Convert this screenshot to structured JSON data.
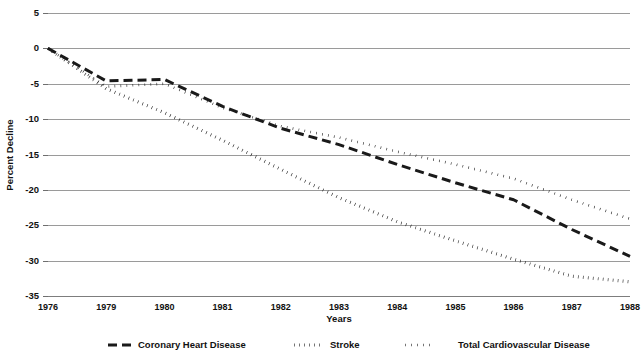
{
  "chart_data": {
    "type": "line",
    "title": "",
    "xlabel": "Years",
    "ylabel": "Percent Decline",
    "x": [
      1976,
      1979,
      1980,
      1981,
      1982,
      1983,
      1984,
      1985,
      1986,
      1987,
      1988
    ],
    "xtick_labels": [
      "1976",
      "1979",
      "1980",
      "1981",
      "1982",
      "1983",
      "1984",
      "1985",
      "1986",
      "1987",
      "1988"
    ],
    "ytick_labels": [
      "5",
      "0",
      "-5",
      "-10",
      "-15",
      "-20",
      "-25",
      "-30",
      "-35"
    ],
    "yticks": [
      5,
      0,
      -5,
      -10,
      -15,
      -20,
      -25,
      -30,
      -35
    ],
    "ylim": [
      -35,
      5
    ],
    "xlim": [
      1976,
      1988
    ],
    "grid": true,
    "legend_position": "bottom",
    "series": [
      {
        "name": "Coronary Heart Disease",
        "dash": "long-dash",
        "values": [
          0,
          -4.6,
          -4.4,
          -8.2,
          -11.3,
          -13.6,
          -16.4,
          -19.0,
          -21.4,
          -25.6,
          -29.4
        ]
      },
      {
        "name": "Stroke",
        "dash": "square-dot",
        "values": [
          0,
          -5.7,
          -9.1,
          -13.0,
          -17.1,
          -21.1,
          -24.5,
          -27.2,
          -29.8,
          -32.2,
          -33.0
        ]
      },
      {
        "name": "Total Cardiovascular Disease",
        "dash": "round-dot",
        "values": [
          0,
          -5.4,
          -5.0,
          -8.4,
          -11.0,
          -12.6,
          -14.6,
          -16.4,
          -18.4,
          -21.4,
          -24.1
        ]
      }
    ]
  },
  "layout": {
    "plot_left": 48,
    "plot_right": 630,
    "plot_top": 13,
    "plot_bottom": 296,
    "xlabel_y": 322,
    "legend_y": 345
  },
  "legend": {
    "entries": [
      {
        "label": "Coronary Heart Disease",
        "swatch_x": 108,
        "label_x": 138,
        "dash": "long-dash"
      },
      {
        "label": "Stroke",
        "swatch_x": 294,
        "label_x": 330,
        "dash": "square-dot"
      },
      {
        "label": "Total Cardiovascular Disease",
        "swatch_x": 405,
        "label_x": 458,
        "dash": "round-dot"
      }
    ]
  },
  "colors": {
    "series_stroke": "#1a1a1a",
    "grid": "#9a9a9a",
    "axis": "#7d7d7d",
    "text": "#111111",
    "background": "#ffffff"
  }
}
